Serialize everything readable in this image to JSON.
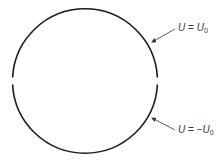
{
  "diagram": {
    "shape": "circle",
    "center": [
      85,
      81
    ],
    "radius": 72.5,
    "gaps": [
      "left-middle",
      "right-middle"
    ],
    "stroke_color": "#1a1a1a",
    "labels": [
      {
        "var": "U",
        "eq": "=",
        "sign": "",
        "rhs": "U",
        "sub": "0",
        "position": "upper-right"
      },
      {
        "var": "U",
        "eq": "=",
        "sign": "−",
        "rhs": "U",
        "sub": "0",
        "position": "lower-right"
      }
    ]
  }
}
